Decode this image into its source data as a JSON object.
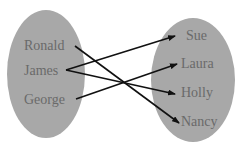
{
  "diagram": {
    "type": "mapping",
    "colors": {
      "set_fill": "#a8a8a8",
      "text": "#6a6a6a",
      "arrow": "#111111"
    },
    "domain": {
      "items": [
        {
          "label": "Ronald",
          "x": 58,
          "y": 45
        },
        {
          "label": "James",
          "x": 58,
          "y": 72
        },
        {
          "label": "George",
          "x": 58,
          "y": 100
        }
      ]
    },
    "codomain": {
      "items": [
        {
          "label": "Sue",
          "x": 185,
          "y": 38
        },
        {
          "label": "Laura",
          "x": 185,
          "y": 65
        },
        {
          "label": "Holly",
          "x": 185,
          "y": 94
        },
        {
          "label": "Nancy",
          "x": 185,
          "y": 122
        }
      ]
    },
    "mappings": [
      {
        "from": "Ronald",
        "to": "Nancy"
      },
      {
        "from": "James",
        "to": "Sue"
      },
      {
        "from": "James",
        "to": "Holly"
      },
      {
        "from": "George",
        "to": "Laura"
      }
    ]
  }
}
